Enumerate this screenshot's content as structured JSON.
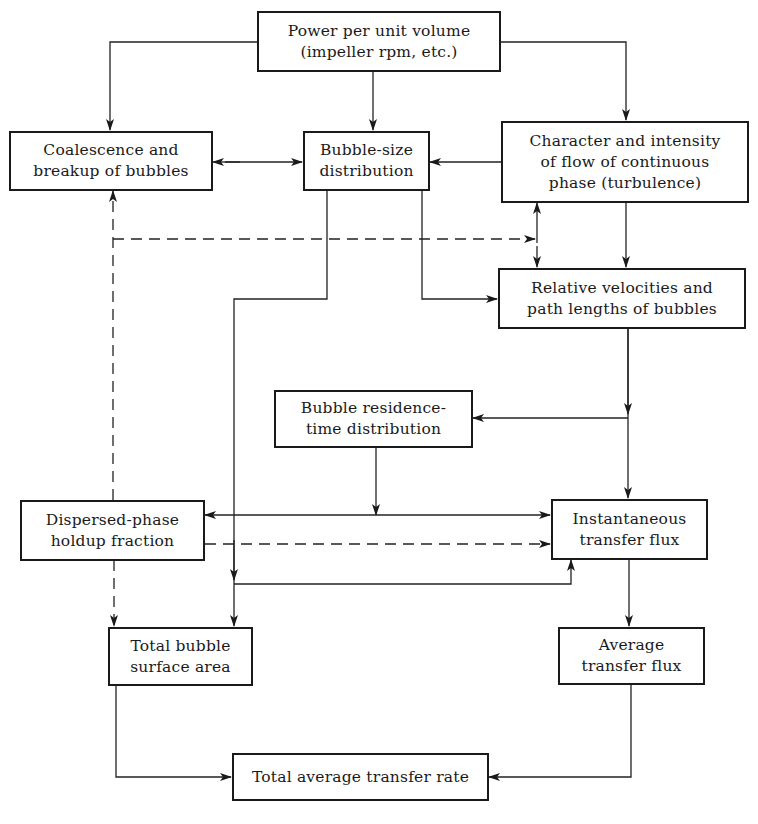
{
  "diagram": {
    "type": "flowchart",
    "nodes": {
      "power": {
        "line1": "Power per unit volume",
        "line2": "(impeller rpm, etc.)"
      },
      "coalescence": {
        "line1": "Coalescence and",
        "line2": "breakup of bubbles"
      },
      "bubble_size": {
        "line1": "Bubble-size",
        "line2": "distribution"
      },
      "character": {
        "line1": "Character and intensity",
        "line2": "of flow of continuous",
        "line3": "phase (turbulence)"
      },
      "relative": {
        "line1": "Relative velocities and",
        "line2": "path lengths of bubbles"
      },
      "residence": {
        "line1": "Bubble residence-",
        "line2": "time distribution"
      },
      "dispersed": {
        "line1": "Dispersed-phase",
        "line2": "holdup fraction"
      },
      "instantaneous": {
        "line1": "Instantaneous",
        "line2": "transfer flux"
      },
      "total_surface": {
        "line1": "Total bubble",
        "line2": "surface area"
      },
      "average_flux": {
        "line1": "Average",
        "line2": "transfer flux"
      },
      "total_rate": {
        "line1": "Total average transfer rate"
      }
    },
    "edges": [
      {
        "from": "power",
        "to": "coalescence",
        "style": "solid"
      },
      {
        "from": "power",
        "to": "bubble_size",
        "style": "solid"
      },
      {
        "from": "power",
        "to": "character",
        "style": "solid"
      },
      {
        "from": "coalescence",
        "to": "bubble_size",
        "style": "solid",
        "bidirectional": true
      },
      {
        "from": "character",
        "to": "bubble_size",
        "style": "solid"
      },
      {
        "from": "character",
        "to": "relative",
        "style": "solid"
      },
      {
        "from": "bubble_size",
        "to": "relative",
        "style": "solid"
      },
      {
        "from": "bubble_size",
        "to": "total_surface",
        "style": "solid"
      },
      {
        "from": "bubble_size",
        "to": "instantaneous",
        "style": "solid"
      },
      {
        "from": "dispersed",
        "to": "coalescence",
        "style": "dashed"
      },
      {
        "from": "dispersed",
        "to": "character",
        "style": "dashed"
      },
      {
        "from": "dispersed",
        "to": "relative",
        "style": "dashed"
      },
      {
        "from": "dispersed",
        "to": "total_surface",
        "style": "dashed"
      },
      {
        "from": "dispersed",
        "to": "instantaneous",
        "style": "dashed"
      },
      {
        "from": "relative",
        "to": "residence",
        "style": "solid"
      },
      {
        "from": "relative",
        "to": "instantaneous",
        "style": "solid"
      },
      {
        "from": "residence",
        "to": "dispersed",
        "style": "solid"
      },
      {
        "from": "residence",
        "to": "instantaneous",
        "style": "solid"
      },
      {
        "from": "instantaneous",
        "to": "average_flux",
        "style": "solid"
      },
      {
        "from": "total_surface",
        "to": "total_rate",
        "style": "solid"
      },
      {
        "from": "average_flux",
        "to": "total_rate",
        "style": "solid"
      }
    ]
  }
}
